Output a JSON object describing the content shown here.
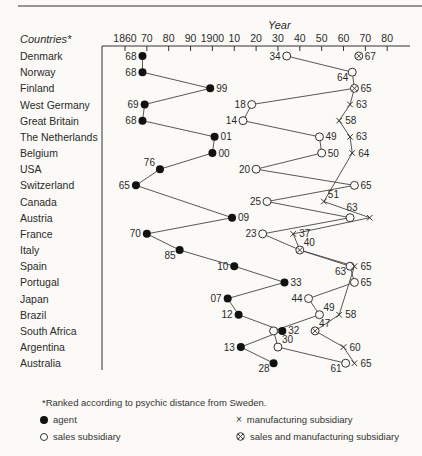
{
  "chart_data": {
    "type": "scatter",
    "title": "",
    "xlabel": "Year",
    "ylabel": "Countries*",
    "x_ticks": [
      "1860",
      "70",
      "80",
      "90",
      "1900",
      "10",
      "20",
      "30",
      "40",
      "50",
      "60",
      "70",
      "80"
    ],
    "x_tick_years": [
      1860,
      1870,
      1880,
      1890,
      1900,
      1910,
      1920,
      1930,
      1940,
      1950,
      1960,
      1970,
      1980
    ],
    "xlim": [
      1860,
      1980
    ],
    "grid": false,
    "countries": [
      "Denmark",
      "Norway",
      "Finland",
      "West Germany",
      "Great Britain",
      "The Netherlands",
      "Belgium",
      "USA",
      "Switzerland",
      "Canada",
      "Austria",
      "France",
      "Italy",
      "Spain",
      "Portugal",
      "Japan",
      "Brazil",
      "South Africa",
      "Argentina",
      "Australia"
    ],
    "series": [
      {
        "name": "agent",
        "marker": "filled-circle",
        "points": [
          {
            "country": "Denmark",
            "year": 1868,
            "label": "68",
            "lp": "l"
          },
          {
            "country": "Norway",
            "year": 1868,
            "label": "68",
            "lp": "l"
          },
          {
            "country": "Finland",
            "year": 1899,
            "label": "99",
            "lp": "r"
          },
          {
            "country": "West Germany",
            "year": 1869,
            "label": "69",
            "lp": "l"
          },
          {
            "country": "Great Britain",
            "year": 1868,
            "label": "68",
            "lp": "l"
          },
          {
            "country": "The Netherlands",
            "year": 1901,
            "label": "01",
            "lp": "r"
          },
          {
            "country": "Belgium",
            "year": 1900,
            "label": "00",
            "lp": "r"
          },
          {
            "country": "USA",
            "year": 1876,
            "label": "76",
            "lp": "tl"
          },
          {
            "country": "Switzerland",
            "year": 1865,
            "label": "65",
            "lp": "l"
          },
          {
            "country": "Austria",
            "year": 1909,
            "label": "09",
            "lp": "r"
          },
          {
            "country": "France",
            "year": 1870,
            "label": "70",
            "lp": "l"
          },
          {
            "country": "Italy",
            "year": 1885,
            "label": "85",
            "lp": "bl"
          },
          {
            "country": "Spain",
            "year": 1910,
            "label": "10",
            "lp": "l"
          },
          {
            "country": "Portugal",
            "year": 1933,
            "label": "33",
            "lp": "r"
          },
          {
            "country": "Japan",
            "year": 1907,
            "label": "07",
            "lp": "l"
          },
          {
            "country": "Brazil",
            "year": 1912,
            "label": "12",
            "lp": "l"
          },
          {
            "country": "South Africa",
            "year": 1932,
            "label": "32",
            "lp": "r"
          },
          {
            "country": "Argentina",
            "year": 1913,
            "label": "13",
            "lp": "l"
          },
          {
            "country": "Australia",
            "year": 1928,
            "label": "28",
            "lp": "bl"
          }
        ]
      },
      {
        "name": "sales subsidiary",
        "marker": "open-circle",
        "points": [
          {
            "country": "Denmark",
            "year": 1934,
            "label": "34",
            "lp": "l"
          },
          {
            "country": "Norway",
            "year": 1964,
            "label": "64",
            "lp": "bl"
          },
          {
            "country": "West Germany",
            "year": 1918,
            "label": "18",
            "lp": "l"
          },
          {
            "country": "Great Britain",
            "year": 1914,
            "label": "14",
            "lp": "l"
          },
          {
            "country": "The Netherlands",
            "year": 1949,
            "label": "49",
            "lp": "r"
          },
          {
            "country": "Belgium",
            "year": 1950,
            "label": "50",
            "lp": "r"
          },
          {
            "country": "USA",
            "year": 1920,
            "label": "20",
            "lp": "l"
          },
          {
            "country": "Switzerland",
            "year": 1965,
            "label": "65",
            "lp": "r"
          },
          {
            "country": "Canada",
            "year": 1925,
            "label": "25",
            "lp": "l"
          },
          {
            "country": "Austria",
            "year": 1963,
            "label": "63",
            "lp": "t"
          },
          {
            "country": "France",
            "year": 1923,
            "label": "23",
            "lp": "l"
          },
          {
            "country": "Spain",
            "year": 1963,
            "label": "63",
            "lp": "bl"
          },
          {
            "country": "Portugal",
            "year": 1965,
            "label": "65",
            "lp": "r"
          },
          {
            "country": "Japan",
            "year": 1944,
            "label": "44",
            "lp": "l"
          },
          {
            "country": "Brazil",
            "year": 1949,
            "label": "49",
            "lp": "tr"
          },
          {
            "country": "South Africa",
            "year": 1928,
            "label": "",
            "lp": "l"
          },
          {
            "country": "Argentina",
            "year": 1930,
            "label": "30",
            "lp": "tr"
          },
          {
            "country": "Australia",
            "year": 1961,
            "label": "61",
            "lp": "bl"
          }
        ]
      },
      {
        "name": "manufacturing subsidiary",
        "marker": "cross",
        "points": [
          {
            "country": "West Germany",
            "year": 1963,
            "label": "63",
            "lp": "r"
          },
          {
            "country": "Great Britain",
            "year": 1958,
            "label": "58",
            "lp": "r"
          },
          {
            "country": "The Netherlands",
            "year": 1963,
            "label": "63",
            "lp": "r"
          },
          {
            "country": "Belgium",
            "year": 1964,
            "label": "64",
            "lp": "r"
          },
          {
            "country": "Canada",
            "year": 1951,
            "label": "51",
            "lp": "tr"
          },
          {
            "country": "Austria",
            "year": 1972,
            "label": "",
            "lp": "r"
          },
          {
            "country": "France",
            "year": 1937,
            "label": "37",
            "lp": "r"
          },
          {
            "country": "Spain",
            "year": 1965,
            "label": "65",
            "lp": "r"
          },
          {
            "country": "Brazil",
            "year": 1958,
            "label": "58",
            "lp": "r"
          },
          {
            "country": "Argentina",
            "year": 1960,
            "label": "60",
            "lp": "r"
          },
          {
            "country": "Australia",
            "year": 1965,
            "label": "65",
            "lp": "r"
          }
        ]
      },
      {
        "name": "sales and manufacturing subsidiary",
        "marker": "circle-cross",
        "points": [
          {
            "country": "Denmark",
            "year": 1967,
            "label": "67",
            "lp": "r"
          },
          {
            "country": "Finland",
            "year": 1965,
            "label": "65",
            "lp": "r"
          },
          {
            "country": "Italy",
            "year": 1940,
            "label": "40",
            "lp": "tr"
          },
          {
            "country": "South Africa",
            "year": 1947,
            "label": "47",
            "lp": "tr"
          }
        ]
      }
    ],
    "connector_lines": {
      "agent": [
        "Denmark",
        "Norway",
        "Finland",
        "West Germany",
        "Great Britain",
        "The Netherlands",
        "Belgium",
        "USA",
        "Switzerland",
        "Austria",
        "France",
        "Italy",
        "Spain",
        "Portugal",
        "Japan",
        "Brazil",
        "South Africa",
        "Argentina",
        "Australia"
      ],
      "sales": [
        "Denmark",
        "Norway",
        "Finland",
        "West Germany",
        "Great Britain",
        "The Netherlands",
        "Belgium",
        "USA",
        "Switzerland",
        "Canada",
        "Austria",
        "France",
        "Italy",
        "Spain",
        "Portugal",
        "Japan",
        "Brazil",
        "South Africa",
        "Argentina",
        "Australia"
      ],
      "manufacturing": [
        "Finland",
        "West Germany",
        "Great Britain",
        "The Netherlands",
        "Belgium",
        "Canada",
        "Austria",
        "France",
        "Italy",
        "Spain",
        "Portugal",
        "Brazil",
        "South Africa",
        "Argentina",
        "Australia"
      ]
    },
    "footnote": "*Ranked according to  psychic distance from Sweden.",
    "legend": [
      {
        "marker": "filled-circle",
        "label": "agent"
      },
      {
        "marker": "open-circle",
        "label": "sales subsidiary"
      },
      {
        "marker": "cross",
        "label": "manufacturing subsidiary"
      },
      {
        "marker": "circle-cross",
        "label": "sales and manufacturing subsidiary"
      }
    ]
  },
  "header": {
    "countries_label": "Countries*",
    "year_label": "Year"
  },
  "legend": {
    "note": "*Ranked according to  psychic distance from Sweden.",
    "agent": "agent",
    "sales": "sales subsidiary",
    "mfg": "manufacturing subsidiary",
    "both": "sales and manufacturing subsidiary"
  }
}
